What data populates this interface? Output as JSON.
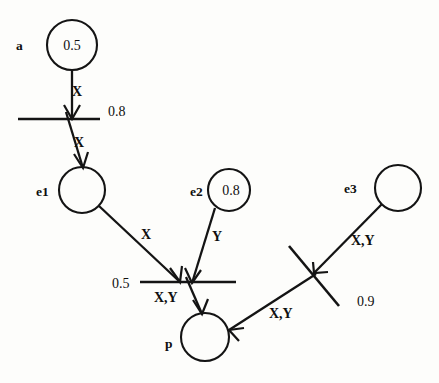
{
  "diagram": {
    "background_color": "#fdfdfb",
    "stroke_color": "#141414",
    "nodes": [
      {
        "id": "a",
        "name": "a",
        "label": "a",
        "value": "0.5",
        "cx": 72,
        "cy": 45,
        "r": 25
      },
      {
        "id": "e1",
        "name": "e1",
        "label": "e1",
        "value": "",
        "cx": 82,
        "cy": 190,
        "r": 23
      },
      {
        "id": "e2",
        "name": "e2",
        "label": "e2",
        "value": "0.8",
        "cx": 229,
        "cy": 190,
        "r": 21
      },
      {
        "id": "e3",
        "name": "e3",
        "label": "e3",
        "value": "0.9",
        "cx": 398,
        "cy": 188,
        "r": 23
      },
      {
        "id": "p",
        "name": "p",
        "label": "p",
        "value": "",
        "cx": 205,
        "cy": 337,
        "r": 24
      }
    ],
    "transitions": [
      {
        "id": "t1",
        "name": "transition-bar-top",
        "weight": "0.8",
        "x1": 18,
        "y1": 119,
        "x2": 100,
        "y2": 119,
        "weight_x": 110,
        "weight_y": 115
      },
      {
        "id": "t2",
        "name": "transition-bar-middle",
        "weight": "0.5",
        "x1": 140,
        "y1": 282,
        "x2": 236,
        "y2": 282,
        "weight_x": 116,
        "weight_y": 287
      },
      {
        "id": "t3",
        "name": "transition-bar-right",
        "weight": "0.9",
        "x1": 289,
        "y1": 246,
        "x2": 339,
        "y2": 306,
        "weight_x": 360,
        "weight_y": 304
      }
    ],
    "edges": [
      {
        "id": "a-to-t1",
        "name": "edge-a-to-transition-top",
        "label": "X",
        "label_x": 78,
        "label_y": 95,
        "x1": 72,
        "y1": 70,
        "x2": 72,
        "y2": 119
      },
      {
        "id": "t1-to-e1",
        "name": "edge-transition-top-to-e1",
        "label": "X",
        "label_x": 80,
        "label_y": 146,
        "x1": 68,
        "y1": 115,
        "x2": 82,
        "y2": 167
      },
      {
        "id": "e1-to-t2",
        "name": "edge-e1-to-transition-middle",
        "label": "X",
        "label_x": 146,
        "label_y": 238,
        "x1": 99,
        "y1": 207,
        "x2": 180,
        "y2": 282
      },
      {
        "id": "e2-to-t2",
        "name": "edge-e2-to-transition-middle",
        "label": "Y",
        "label_x": 216,
        "label_y": 240,
        "x1": 214,
        "y1": 207,
        "x2": 191,
        "y2": 282
      },
      {
        "id": "t2-to-p",
        "name": "edge-transition-middle-to-p",
        "label": "X,Y",
        "label_x": 157,
        "label_y": 303,
        "x1": 186,
        "y1": 278,
        "x2": 201,
        "y2": 313
      },
      {
        "id": "e3-to-t3",
        "name": "edge-e3-to-transition-right",
        "label": "X,Y",
        "label_x": 355,
        "label_y": 244,
        "x1": 381,
        "y1": 205,
        "x2": 316,
        "y2": 272
      },
      {
        "id": "t3-to-p",
        "name": "edge-transition-right-to-p",
        "label": "X,Y",
        "label_x": 272,
        "label_y": 317,
        "x1": 314,
        "y1": 274,
        "x2": 229,
        "y2": 329
      }
    ]
  }
}
